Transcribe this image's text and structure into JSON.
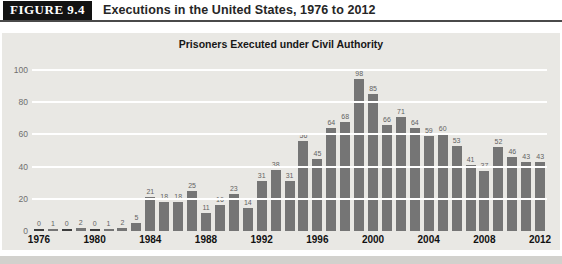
{
  "figure_header": {
    "label": "FIGURE 9.4",
    "title": "Executions in the United States, 1976 to 2012"
  },
  "chart_data": {
    "type": "bar",
    "title": "Prisoners Executed under Civil Authority",
    "xlabel": "",
    "ylabel": "",
    "x": [
      1976,
      1977,
      1978,
      1979,
      1980,
      1981,
      1982,
      1983,
      1984,
      1985,
      1986,
      1987,
      1988,
      1989,
      1990,
      1991,
      1992,
      1993,
      1994,
      1995,
      1996,
      1997,
      1998,
      1999,
      2000,
      2001,
      2002,
      2003,
      2004,
      2005,
      2006,
      2007,
      2008,
      2009,
      2010,
      2011,
      2012
    ],
    "values": [
      0,
      1,
      0,
      2,
      0,
      1,
      2,
      5,
      21,
      18,
      18,
      25,
      11,
      16,
      23,
      14,
      31,
      38,
      31,
      56,
      45,
      64,
      68,
      98,
      85,
      66,
      71,
      64,
      59,
      60,
      53,
      41,
      37,
      52,
      46,
      43,
      43
    ],
    "value_labels_shown": true,
    "xticks": [
      1976,
      1980,
      1984,
      1988,
      1992,
      1996,
      2000,
      2004,
      2008,
      2012
    ],
    "yticks": [
      0,
      20,
      40,
      60,
      80,
      100
    ],
    "ylim": [
      0,
      100
    ],
    "grid": "horizontal-white",
    "legend": "none",
    "colors": {
      "bar": "#757575",
      "zero_bar": "#3d3d3d",
      "panel_background": "#e9e8e4",
      "gridline": "#ffffff",
      "header_box": "#121212",
      "header_text": "#ffffff"
    }
  }
}
